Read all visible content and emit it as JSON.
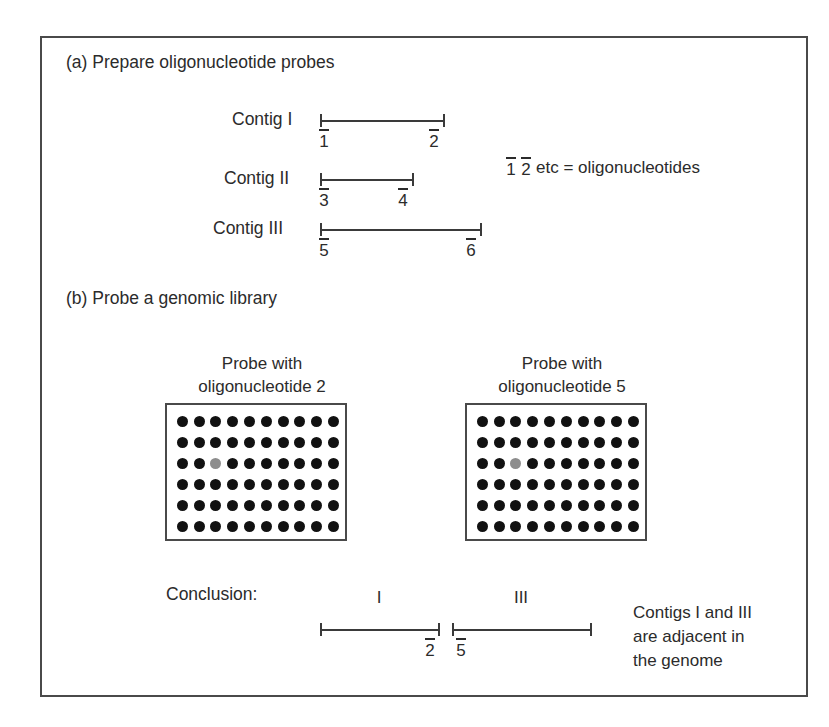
{
  "figure": {
    "sections": {
      "a_title": "(a) Prepare oligonucleotide probes",
      "b_title": "(b) Probe a genomic library"
    },
    "contigs": [
      {
        "label": "Contig I",
        "left_oligo": "1",
        "right_oligo": "2"
      },
      {
        "label": "Contig II",
        "left_oligo": "3",
        "right_oligo": "4"
      },
      {
        "label": "Contig III",
        "left_oligo": "5",
        "right_oligo": "6"
      }
    ],
    "legend": {
      "oligo_a": "1",
      "oligo_b": "2",
      "text": "etc = oligonucleotides"
    },
    "probes": [
      {
        "line1": "Probe with",
        "line2": "oligonucleotide 2",
        "grid": {
          "rows": 6,
          "cols": 10,
          "hit_row": 3,
          "hit_col": 3
        }
      },
      {
        "line1": "Probe with",
        "line2": "oligonucleotide 5",
        "grid": {
          "rows": 6,
          "cols": 10,
          "hit_row": 3,
          "hit_col": 3
        }
      }
    ],
    "conclusion": {
      "label": "Conclusion:",
      "left_segment_roman": "I",
      "right_segment_roman": "III",
      "left_oligo": "2",
      "right_oligo": "5",
      "note_line1": "Contigs I and III",
      "note_line2": "are adjacent in",
      "note_line3": "the genome"
    },
    "colors": {
      "ink": "#2b2b2b",
      "rule": "#3a3a3a",
      "frame": "#4a4a4a",
      "dot": "#111111",
      "dot_hit": "#8d8d8d",
      "background": "#ffffff"
    }
  }
}
